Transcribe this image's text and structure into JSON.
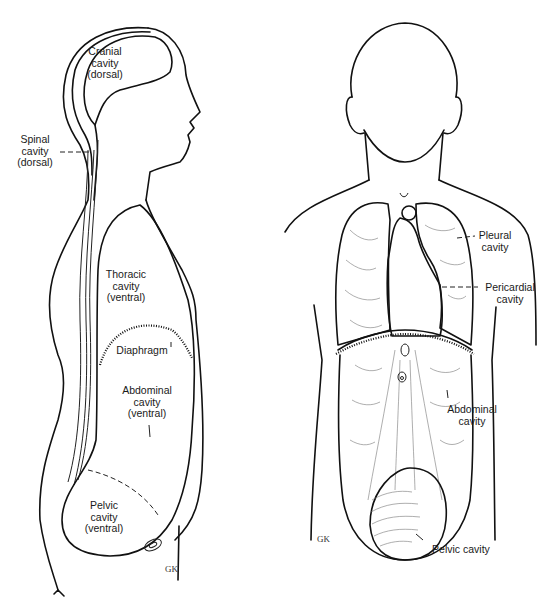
{
  "diagram": {
    "type": "anatomical-illustration",
    "views": [
      {
        "name": "lateral-view",
        "labels": [
          {
            "id": "cranial",
            "text": "Cranial\ncavity\n(dorsal)"
          },
          {
            "id": "spinal",
            "text": "Spinal\ncavity\n(dorsal)"
          },
          {
            "id": "thoracic",
            "text": "Thoracic\ncavity\n(ventral)"
          },
          {
            "id": "diaphragm",
            "text": "Diaphragm"
          },
          {
            "id": "abdominal",
            "text": "Abdominal\ncavity\n(ventral)"
          },
          {
            "id": "pelvic",
            "text": "Pelvic\ncavity\n(ventral)"
          }
        ]
      },
      {
        "name": "anterior-view",
        "labels": [
          {
            "id": "pleural",
            "text": "Pleural\ncavity"
          },
          {
            "id": "pericardial",
            "text": "Pericardial\ncavity"
          },
          {
            "id": "abdominal",
            "text": "Abdominal\ncavity"
          },
          {
            "id": "pelvic",
            "text": "Pelvic cavity"
          }
        ]
      }
    ],
    "colors": {
      "line": "#111111",
      "background": "#ffffff"
    }
  }
}
